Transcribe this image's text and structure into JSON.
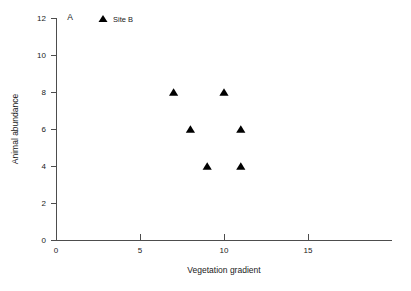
{
  "chart_data": {
    "type": "scatter",
    "title": "",
    "panel_label": "A",
    "xlabel": "Vegetation gradient",
    "ylabel": "Animal abundance",
    "xlim": [
      0,
      20
    ],
    "ylim": [
      0,
      12
    ],
    "xticks": [
      0,
      5,
      10,
      15
    ],
    "xtick_labels": [
      "0",
      "5",
      "10",
      "15"
    ],
    "yticks": [
      0,
      2,
      4,
      6,
      8,
      10,
      12
    ],
    "ytick_labels": [
      "0",
      "2",
      "4",
      "6",
      "8",
      "10",
      "12"
    ],
    "grid": false,
    "legend_position": "top-left-inside",
    "marker_color": "#000000",
    "marker_shape": "triangle-up",
    "axis_color": "#4d4d4d",
    "background_color": "#ffffff",
    "series": [
      {
        "name": "Site B",
        "marker": "triangle-up",
        "color": "#000000",
        "points": [
          {
            "x": 7,
            "y": 8
          },
          {
            "x": 10,
            "y": 8
          },
          {
            "x": 8,
            "y": 6
          },
          {
            "x": 11,
            "y": 6
          },
          {
            "x": 9,
            "y": 4
          },
          {
            "x": 11,
            "y": 4
          }
        ]
      }
    ]
  },
  "legend": {
    "entries": [
      {
        "label": "Site B",
        "marker": "triangle-up",
        "color": "#000000"
      }
    ]
  },
  "axis_labels": {
    "x": "Vegetation gradient",
    "y": "Animal abundance"
  },
  "panel": {
    "label": "A"
  }
}
